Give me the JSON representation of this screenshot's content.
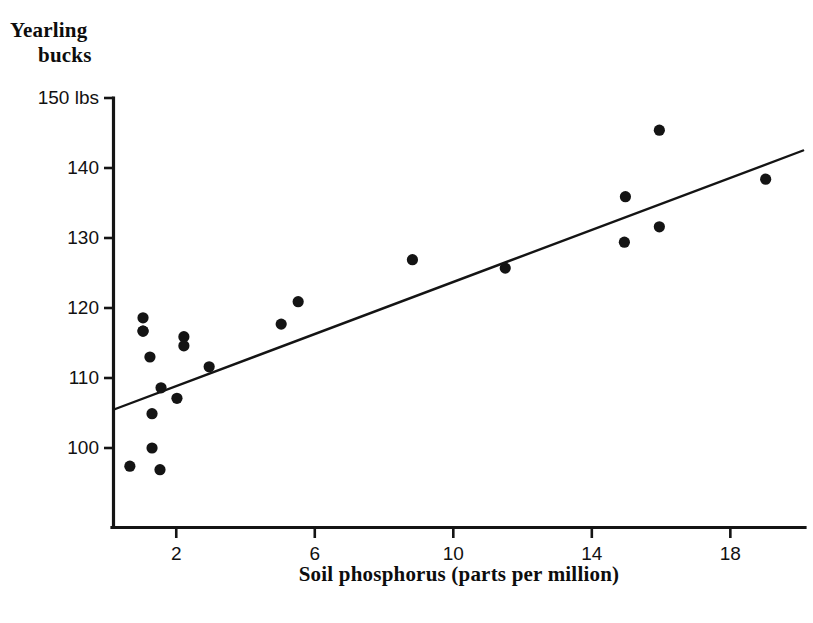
{
  "chart_data": {
    "type": "scatter",
    "title": "",
    "ylabel_line1": "Yearling",
    "ylabel_line2": "bucks",
    "xlabel": "Soil phosphorus (parts per million)",
    "xlim": [
      0,
      20.2
    ],
    "ylim": [
      95.5,
      150
    ],
    "grid": false,
    "legend": null,
    "xticks": [
      2,
      6,
      10,
      14,
      18
    ],
    "xtick_labels": [
      "2",
      "6",
      "10",
      "14",
      "18"
    ],
    "yticks": [
      100,
      110,
      120,
      130,
      140,
      150
    ],
    "ytick_labels": [
      "100",
      "110",
      "120",
      "130",
      "140",
      "150 lbs"
    ],
    "y_unit": "lbs",
    "point_count": 22,
    "points": [
      {
        "x": 1.04,
        "y": 116.7
      },
      {
        "x": 1.24,
        "y": 113.0
      },
      {
        "x": 1.04,
        "y": 118.6
      },
      {
        "x": 1.04,
        "y": 116.7
      },
      {
        "x": 1.3,
        "y": 104.9
      },
      {
        "x": 1.56,
        "y": 108.6
      },
      {
        "x": 1.3,
        "y": 100.0
      },
      {
        "x": 0.66,
        "y": 97.4
      },
      {
        "x": 1.53,
        "y": 96.9
      },
      {
        "x": 2.02,
        "y": 107.1
      },
      {
        "x": 2.22,
        "y": 115.9
      },
      {
        "x": 2.22,
        "y": 114.6
      },
      {
        "x": 2.95,
        "y": 111.6
      },
      {
        "x": 5.03,
        "y": 117.7
      },
      {
        "x": 5.52,
        "y": 120.9
      },
      {
        "x": 8.82,
        "y": 126.9
      },
      {
        "x": 11.5,
        "y": 125.7
      },
      {
        "x": 14.97,
        "y": 135.9
      },
      {
        "x": 14.94,
        "y": 129.4
      },
      {
        "x": 15.95,
        "y": 145.4
      },
      {
        "x": 15.95,
        "y": 131.6
      },
      {
        "x": 19.02,
        "y": 138.4
      }
    ],
    "regression_line": {
      "x_start": 0.2,
      "y_start": 105.5,
      "x_end": 20.1,
      "y_end": 142.5
    },
    "series_names": [
      "Yearling buck weight"
    ],
    "colors": {
      "axis": "#141414",
      "point": "#141414",
      "line": "#141414",
      "background": "#ffffff"
    }
  }
}
